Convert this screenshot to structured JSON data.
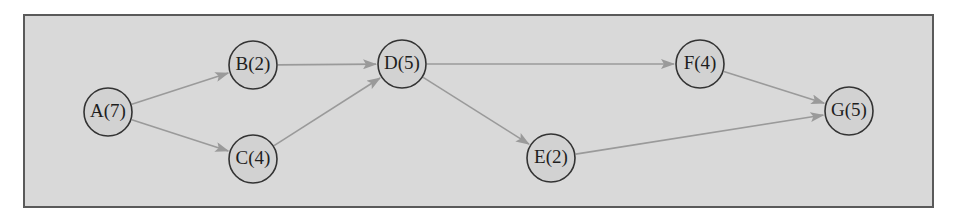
{
  "diagram": {
    "type": "network",
    "frame": {
      "x": 24,
      "y": 15,
      "width": 909,
      "height": 192
    },
    "colors": {
      "background": "#d9d9d9",
      "frame_border": "#5a5a5a",
      "node_fill": "#d2d2d2",
      "node_stroke": "#333333",
      "edge": "#9a9a9a",
      "text": "#1e1e1e"
    },
    "node_radius": 24,
    "nodes": [
      {
        "id": "A",
        "label": "A(7)",
        "duration": 7,
        "x": 108,
        "y": 112
      },
      {
        "id": "B",
        "label": "B(2)",
        "duration": 2,
        "x": 253,
        "y": 65
      },
      {
        "id": "C",
        "label": "C(4)",
        "duration": 4,
        "x": 253,
        "y": 159
      },
      {
        "id": "D",
        "label": "D(5)",
        "duration": 5,
        "x": 402,
        "y": 64
      },
      {
        "id": "E",
        "label": "E(2)",
        "duration": 2,
        "x": 551,
        "y": 158
      },
      {
        "id": "F",
        "label": "F(4)",
        "duration": 4,
        "x": 700,
        "y": 64
      },
      {
        "id": "G",
        "label": "G(5)",
        "duration": 5,
        "x": 849,
        "y": 111
      }
    ],
    "edges": [
      {
        "from": "A",
        "to": "B"
      },
      {
        "from": "A",
        "to": "C"
      },
      {
        "from": "B",
        "to": "D"
      },
      {
        "from": "C",
        "to": "D"
      },
      {
        "from": "D",
        "to": "F"
      },
      {
        "from": "D",
        "to": "E"
      },
      {
        "from": "F",
        "to": "G"
      },
      {
        "from": "E",
        "to": "G"
      }
    ]
  }
}
